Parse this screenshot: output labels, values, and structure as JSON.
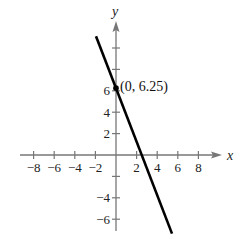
{
  "chart_data": {
    "type": "line",
    "title": "",
    "xlabel": "x",
    "ylabel": "y",
    "xlim": [
      -9.5,
      10.2
    ],
    "ylim": [
      -7.5,
      12.4
    ],
    "x_ticks": [
      -8,
      -6,
      -4,
      -2,
      2,
      4,
      6,
      8
    ],
    "x_tick_labels": [
      "−8",
      "−6",
      "−4",
      "−2",
      "2",
      "4",
      "6",
      "8"
    ],
    "y_ticks": [
      10,
      8,
      6,
      4,
      2,
      -2,
      -4,
      -6
    ],
    "y_tick_labels": [
      "",
      "",
      "6",
      "4",
      "2",
      "",
      "−4",
      "−6"
    ],
    "grid": false,
    "series": [
      {
        "name": "line",
        "equation": "y = -2.5x + 6.25",
        "x": [
          -1.94,
          5.44
        ],
        "y": [
          11.1,
          -7.35
        ],
        "color": "#000000"
      }
    ],
    "points": [
      {
        "x": 0,
        "y": 6.25,
        "label": "(0, 6.25)"
      }
    ],
    "annotations": [
      "(0, 6.25)"
    ]
  },
  "style": {
    "axis_color": "#777777",
    "line_color": "#000000",
    "text_color": "#222222"
  }
}
